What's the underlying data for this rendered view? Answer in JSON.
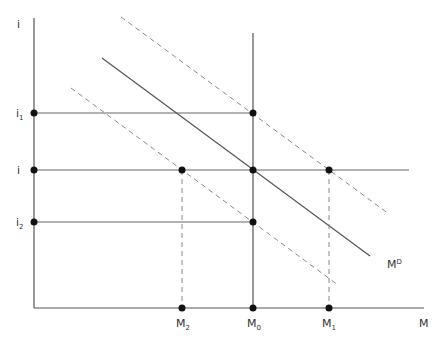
{
  "diagram": {
    "title": "",
    "y_axis_label": "i",
    "x_axis_label": "M",
    "y_labels": [
      {
        "id": "i1",
        "main": "i",
        "sub": "1"
      },
      {
        "id": "i",
        "main": "i",
        "sub": ""
      },
      {
        "id": "i2",
        "main": "i",
        "sub": "2"
      }
    ],
    "x_labels": [
      {
        "id": "M2",
        "main": "M",
        "sub": "2"
      },
      {
        "id": "M0",
        "main": "M",
        "sub": "0"
      },
      {
        "id": "M1",
        "main": "M",
        "sub": "1"
      }
    ],
    "curve_label": {
      "main": "M",
      "sup": "D"
    },
    "colors": {
      "line": "#444444",
      "dashed": "#888888",
      "dot": "#111111"
    }
  }
}
